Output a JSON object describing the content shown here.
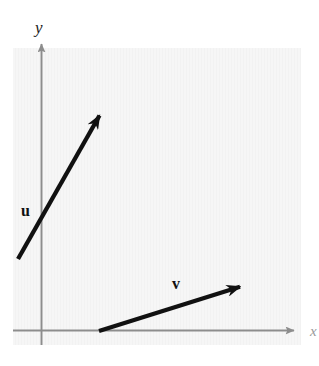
{
  "figure": {
    "type": "vector-diagram",
    "panel": {
      "fill_color": "#f6f6f6",
      "x": 13,
      "y": 48,
      "width": 288,
      "height": 297
    },
    "axes": {
      "color": "#8d8d8d",
      "x_axis": {
        "label": "x",
        "from": [
          13,
          330
        ],
        "to": [
          302,
          330
        ],
        "arrowhead": "right"
      },
      "y_axis": {
        "label": "y",
        "from": [
          41,
          345
        ],
        "to": [
          41,
          41
        ],
        "arrowhead": "up"
      }
    },
    "vectors": [
      {
        "name": "u",
        "label": "u",
        "label_style": "bold",
        "color": "#111111",
        "tail": [
          18,
          259
        ],
        "tip": [
          102,
          111
        ],
        "stroke_width": 4.2,
        "label_position": [
          21,
          203
        ]
      },
      {
        "name": "v",
        "label": "v",
        "label_style": "bold",
        "color": "#111111",
        "tail": [
          99,
          331
        ],
        "tip": [
          252,
          283
        ],
        "stroke_width": 4.2,
        "label_position": [
          172,
          276
        ]
      }
    ]
  },
  "labels": {
    "y_axis": "y",
    "x_axis": "x",
    "vector_u": "u",
    "vector_v": "v"
  }
}
